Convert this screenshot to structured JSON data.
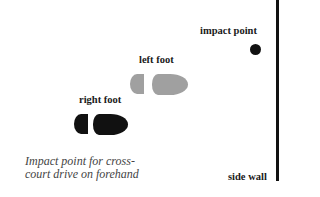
{
  "diagram": {
    "labels": {
      "impact_point": "impact point",
      "left_foot": "left foot",
      "right_foot": "right foot",
      "side_wall": "side wall"
    },
    "caption": {
      "line1": "Impact point for cross-",
      "line2": "court drive on forehand"
    },
    "colors": {
      "right_foot": "#111111",
      "left_foot": "#a0a0a0",
      "impact_point": "#111111",
      "side_wall": "#111111"
    }
  }
}
